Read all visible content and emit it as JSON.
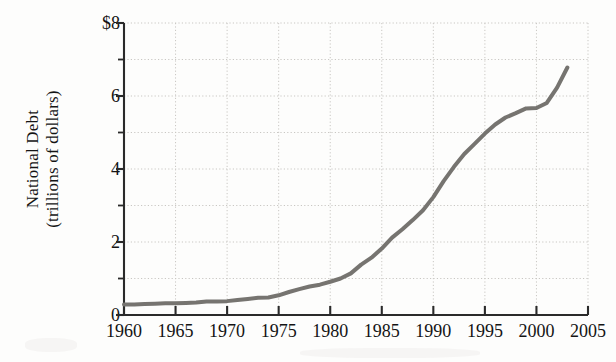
{
  "chart_data": {
    "type": "line",
    "title": "",
    "xlabel": "",
    "ylabel": "National Debt (trillions of dollars)",
    "ylabel_line1": "National Debt",
    "ylabel_line2": "(trillions of dollars)",
    "xlim": [
      1960,
      2005
    ],
    "ylim": [
      0,
      8
    ],
    "grid": true,
    "legend": null,
    "y_major_ticks": [
      0,
      2,
      4,
      6,
      8
    ],
    "y_major_tick_labels": [
      "0",
      "2",
      "4",
      "6",
      "$8"
    ],
    "y_minor_ticks": [
      1,
      3,
      5,
      7
    ],
    "x_major_ticks": [
      1960,
      1965,
      1970,
      1975,
      1980,
      1985,
      1990,
      1995,
      2000,
      2005
    ],
    "x_major_tick_labels": [
      "1960",
      "1965",
      "1970",
      "1975",
      "1980",
      "1985",
      "1990",
      "1995",
      "2000",
      "2005"
    ],
    "series": [
      {
        "name": "National Debt",
        "color": "#767470",
        "line_width": 4,
        "x": [
          1960,
          1961,
          1962,
          1963,
          1964,
          1965,
          1966,
          1967,
          1968,
          1969,
          1970,
          1971,
          1972,
          1973,
          1974,
          1975,
          1976,
          1977,
          1978,
          1979,
          1980,
          1981,
          1982,
          1983,
          1984,
          1985,
          1986,
          1987,
          1988,
          1989,
          1990,
          1991,
          1992,
          1993,
          1994,
          1995,
          1996,
          1997,
          1998,
          1999,
          2000,
          2001,
          2002,
          2003
        ],
        "y": [
          0.29,
          0.29,
          0.3,
          0.31,
          0.32,
          0.32,
          0.33,
          0.34,
          0.37,
          0.37,
          0.38,
          0.41,
          0.44,
          0.47,
          0.48,
          0.54,
          0.63,
          0.71,
          0.78,
          0.83,
          0.91,
          1.0,
          1.14,
          1.38,
          1.57,
          1.82,
          2.12,
          2.35,
          2.6,
          2.87,
          3.23,
          3.67,
          4.06,
          4.41,
          4.69,
          4.97,
          5.22,
          5.41,
          5.53,
          5.66,
          5.67,
          5.81,
          6.23,
          6.78
        ]
      }
    ]
  },
  "axis": {
    "y_title_line1": "National Debt",
    "y_title_line2": "(trillions of dollars)"
  }
}
